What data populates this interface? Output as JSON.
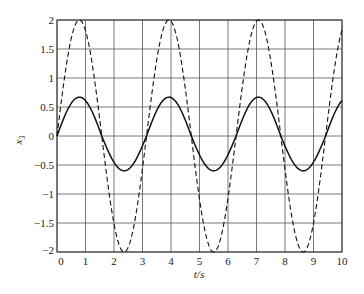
{
  "chart_data": {
    "type": "line",
    "title": "",
    "xlabel": "t/s",
    "ylabel": "x3",
    "ylabel_main": "x",
    "ylabel_sub": "3",
    "xlim": [
      0,
      10
    ],
    "ylim": [
      -2,
      2
    ],
    "grid": true,
    "legend": "none",
    "xticks": [
      "0",
      "1",
      "2",
      "3",
      "4",
      "5",
      "6",
      "7",
      "8",
      "9",
      "10"
    ],
    "yticks": [
      "2",
      "1.5",
      "1",
      "0.5",
      "0",
      "-0.5",
      "-1",
      "-1.5",
      "-2"
    ],
    "series": [
      {
        "name": "solid",
        "style": "solid",
        "x": [
          0,
          0.5,
          0.79,
          1.0,
          1.5,
          2.0,
          2.36,
          2.5,
          3.0,
          3.5,
          3.93,
          4.5,
          5.0,
          5.5,
          6.0,
          6.5,
          7.07,
          7.5,
          8.0,
          8.64,
          9.0,
          9.5,
          10.0
        ],
        "values": [
          0.0,
          0.57,
          0.67,
          0.61,
          0.12,
          -0.44,
          -0.6,
          -0.58,
          -0.14,
          0.45,
          0.67,
          0.31,
          -0.31,
          -0.6,
          -0.3,
          0.31,
          0.67,
          0.45,
          -0.14,
          -0.6,
          -0.44,
          0.12,
          0.6
        ]
      },
      {
        "name": "dashed",
        "style": "dashed",
        "x": [
          0,
          0.5,
          0.79,
          1.0,
          1.5,
          2.0,
          2.36,
          2.5,
          3.0,
          3.5,
          3.93,
          4.5,
          5.0,
          5.5,
          6.0,
          6.5,
          7.07,
          7.5,
          8.0,
          8.64,
          9.0,
          9.5,
          10.0
        ],
        "values": [
          0.0,
          1.68,
          2.0,
          1.82,
          0.28,
          -1.51,
          -2.0,
          -1.92,
          -0.56,
          1.31,
          2.0,
          0.82,
          -1.09,
          -2.0,
          -1.07,
          0.84,
          2.0,
          1.3,
          -0.58,
          -2.0,
          -1.5,
          0.3,
          1.83
        ]
      }
    ]
  }
}
